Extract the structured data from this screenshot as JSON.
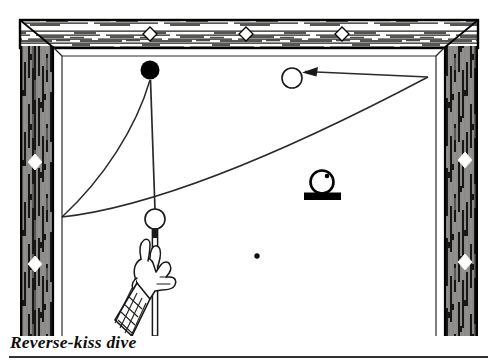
{
  "figure": {
    "title": "Reverse-kiss dive",
    "colors": {
      "ink": "#000000",
      "rail_dark": "#121110",
      "cloth": "#ffffff",
      "line": "#2b2a28",
      "caption": "#100f0d"
    },
    "table": {
      "outer": {
        "x": 20,
        "y": 20,
        "width": 458,
        "height": 316
      },
      "rail_width_top": 28,
      "rail_width_side": 34,
      "playing_surface": {
        "x": 54,
        "y": 48,
        "width": 390,
        "height": 288
      },
      "rails": [
        {
          "name": "top-rail",
          "orientation": "horizontal"
        },
        {
          "name": "left-rail",
          "orientation": "vertical"
        },
        {
          "name": "right-rail",
          "orientation": "vertical"
        }
      ],
      "diamonds": {
        "top": [
          {
            "cx": 150,
            "cy": 34
          },
          {
            "cx": 246,
            "cy": 34
          },
          {
            "cx": 342,
            "cy": 34
          }
        ],
        "left": [
          {
            "cx": 35,
            "cy": 162
          },
          {
            "cx": 35,
            "cy": 264
          }
        ],
        "right": [
          {
            "cx": 465,
            "cy": 160
          },
          {
            "cx": 465,
            "cy": 262
          }
        ]
      }
    },
    "balls": [
      {
        "name": "object-ball",
        "style": "solid-black",
        "cx": 150,
        "cy": 70,
        "r": 9.5
      },
      {
        "name": "target-ball",
        "style": "open-white",
        "cx": 292,
        "cy": 78,
        "r": 10
      },
      {
        "name": "cue-ball",
        "style": "open-white",
        "cx": 155,
        "cy": 219,
        "r": 10
      }
    ],
    "spot": {
      "name": "table-spot",
      "cx": 257,
      "cy": 256,
      "r": 2.6
    },
    "english_indicator": {
      "name": "english-diagram",
      "ball": {
        "cx": 322,
        "cy": 182,
        "r": 11.5
      },
      "tip_dot": {
        "cx": 327,
        "cy": 176,
        "r": 2.2
      },
      "base_bar": {
        "x": 304,
        "y": 193,
        "width": 37,
        "height": 7
      },
      "meaning": "high-right-english"
    },
    "paths": [
      {
        "name": "cue-ball-to-object-ball",
        "kind": "straight",
        "from": {
          "x": 155,
          "y": 210
        },
        "to": {
          "x": 150,
          "y": 79
        }
      },
      {
        "name": "dive-curve",
        "kind": "curve",
        "from": {
          "x": 150,
          "y": 79
        },
        "to": {
          "x": 62,
          "y": 217
        },
        "control": {
          "x": 92,
          "y": 190
        }
      },
      {
        "name": "rebound-curve",
        "kind": "curve",
        "from": {
          "x": 62,
          "y": 217
        },
        "to": {
          "x": 428,
          "y": 77
        },
        "control": {
          "x": 230,
          "y": 190
        }
      },
      {
        "name": "return-leg",
        "kind": "straight",
        "from": {
          "x": 428,
          "y": 77
        },
        "to": {
          "x": 303,
          "y": 72
        },
        "arrowhead": {
          "x": 303,
          "y": 72,
          "direction": "left"
        }
      }
    ],
    "player": {
      "name": "bridge-hand",
      "cue": {
        "x": 155,
        "y_top": 229,
        "y_bottom": 336,
        "width": 4
      },
      "cuff_pattern": "cross-hatch-plaid"
    }
  }
}
